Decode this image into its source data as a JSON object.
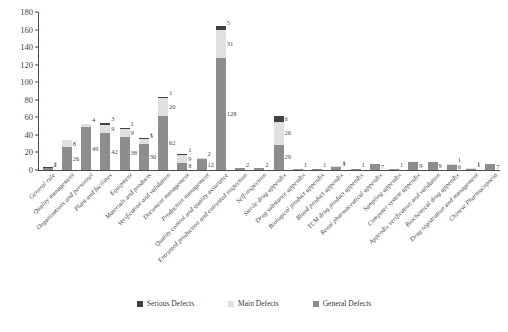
{
  "chart_data": {
    "type": "bar",
    "subtype": "stacked-bar",
    "title": "",
    "subtitle": "",
    "xlabel": "",
    "ylabel": "",
    "ylim": [
      0,
      180
    ],
    "yticks": [
      0,
      20,
      40,
      60,
      80,
      100,
      120,
      140,
      160,
      180
    ],
    "grid": false,
    "legend_position": "bottom-center",
    "stack_order": [
      "General Defects",
      "Main Defects",
      "Serious Defects"
    ],
    "categories": [
      "General rule",
      "Quality management",
      "Organizations and personnel",
      "Plant and facilities",
      "Equipment",
      "Materials and products",
      "Verification and validation",
      "Document management",
      "Production management",
      "Quality control and quality assurance",
      "Entrusted production and entrusted inspection",
      "Self-inspection",
      "Sterile drug appendix",
      "Drug substance appendix",
      "Biological product appendix",
      "Blood product appendix",
      "TCM drug product appendix",
      "Renal pharmaceutical appendix",
      "Sampling appendix",
      "Computer system appendix",
      "Appendix verification and validation",
      "Biochemical drug appendix",
      "Drug registration and management",
      "Chinese Pharmacopoeia"
    ],
    "series": [
      {
        "name": "Serious Defects",
        "color": "#404040",
        "values": [
          1,
          0,
          0,
          3,
          1,
          1,
          1,
          1,
          0,
          5,
          0,
          0,
          6,
          0,
          0,
          0,
          0,
          0,
          0,
          0,
          0,
          0,
          0,
          0
        ]
      },
      {
        "name": "Main Defects",
        "color": "#e0e0e0",
        "values": [
          0,
          8,
          4,
          9,
          9,
          5,
          20,
          9,
          2,
          31,
          0,
          0,
          26,
          0,
          0,
          1,
          0,
          0,
          0,
          0,
          0,
          1,
          1,
          0
        ]
      },
      {
        "name": "General Defects",
        "color": "#8d8d8d",
        "values": [
          2,
          26,
          49,
          42,
          38,
          30,
          62,
          8,
          12,
          128,
          2,
          2,
          29,
          1,
          1,
          3,
          1,
          7,
          1,
          9,
          9,
          6,
          1,
          7
        ]
      }
    ],
    "bar_segment_labels": [
      {
        "category": "General rule",
        "labels": [
          {
            "series": "Serious Defects",
            "value": "1"
          },
          {
            "series": "General Defects",
            "value": "2"
          }
        ]
      },
      {
        "category": "Quality management",
        "labels": [
          {
            "series": "Main Defects",
            "value": "8"
          },
          {
            "series": "General Defects",
            "value": "26"
          }
        ]
      },
      {
        "category": "Organizations and personnel",
        "labels": [
          {
            "series": "Main Defects",
            "value": "4"
          },
          {
            "series": "General Defects",
            "value": "49"
          }
        ]
      },
      {
        "category": "Plant and facilities",
        "labels": [
          {
            "series": "Serious Defects",
            "value": "3"
          },
          {
            "series": "Main Defects",
            "value": "9"
          },
          {
            "series": "General Defects",
            "value": "42"
          }
        ]
      },
      {
        "category": "Equipment",
        "labels": [
          {
            "series": "Serious Defects",
            "value": "1"
          },
          {
            "series": "Main Defects",
            "value": "9"
          },
          {
            "series": "General Defects",
            "value": "38"
          }
        ]
      },
      {
        "category": "Materials and products",
        "labels": [
          {
            "series": "Serious Defects",
            "value": "1"
          },
          {
            "series": "Main Defects",
            "value": "5"
          },
          {
            "series": "General Defects",
            "value": "30"
          }
        ]
      },
      {
        "category": "Verification and validation",
        "labels": [
          {
            "series": "Serious Defects",
            "value": "1"
          },
          {
            "series": "Main Defects",
            "value": "20"
          },
          {
            "series": "General Defects",
            "value": "62"
          }
        ]
      },
      {
        "category": "Document management",
        "labels": [
          {
            "series": "Serious Defects",
            "value": "1"
          },
          {
            "series": "Main Defects",
            "value": "9"
          },
          {
            "series": "General Defects",
            "value": "8"
          }
        ]
      },
      {
        "category": "Production management",
        "labels": [
          {
            "series": "Main Defects",
            "value": "2"
          },
          {
            "series": "General Defects",
            "value": "12"
          }
        ]
      },
      {
        "category": "Quality control and quality assurance",
        "labels": [
          {
            "series": "Serious Defects",
            "value": "5"
          },
          {
            "series": "Main Defects",
            "value": "31"
          },
          {
            "series": "General Defects",
            "value": "128"
          }
        ]
      },
      {
        "category": "Entrusted production and entrusted inspection",
        "labels": [
          {
            "series": "General Defects",
            "value": "2"
          }
        ]
      },
      {
        "category": "Self-inspection",
        "labels": [
          {
            "series": "General Defects",
            "value": "2"
          }
        ]
      },
      {
        "category": "Sterile drug appendix",
        "labels": [
          {
            "series": "Serious Defects",
            "value": "6"
          },
          {
            "series": "Main Defects",
            "value": "26"
          },
          {
            "series": "General Defects",
            "value": "29"
          }
        ]
      },
      {
        "category": "Drug substance appendix",
        "labels": [
          {
            "series": "General Defects",
            "value": "1"
          }
        ]
      },
      {
        "category": "Biological product appendix",
        "labels": [
          {
            "series": "General Defects",
            "value": "1"
          }
        ]
      },
      {
        "category": "Blood product appendix",
        "labels": [
          {
            "series": "Main Defects",
            "value": "1"
          },
          {
            "series": "General Defects",
            "value": "3"
          }
        ]
      },
      {
        "category": "TCM drug product appendix",
        "labels": [
          {
            "series": "General Defects",
            "value": "1"
          }
        ]
      },
      {
        "category": "Renal pharmaceutical appendix",
        "labels": [
          {
            "series": "General Defects",
            "value": "7"
          }
        ]
      },
      {
        "category": "Sampling appendix",
        "labels": [
          {
            "series": "General Defects",
            "value": "1"
          }
        ]
      },
      {
        "category": "Computer system appendix",
        "labels": [
          {
            "series": "General Defects",
            "value": "9"
          }
        ]
      },
      {
        "category": "Appendix verification and validation",
        "labels": [
          {
            "series": "General Defects",
            "value": "9"
          }
        ]
      },
      {
        "category": "Biochemical drug appendix",
        "labels": [
          {
            "series": "Main Defects",
            "value": "1"
          },
          {
            "series": "General Defects",
            "value": "6"
          }
        ]
      },
      {
        "category": "Drug registration and management",
        "labels": [
          {
            "series": "Main Defects",
            "value": "1"
          },
          {
            "series": "General Defects",
            "value": "1"
          }
        ]
      },
      {
        "category": "Chinese Pharmacopoeia",
        "labels": [
          {
            "series": "General Defects",
            "value": "7"
          }
        ]
      }
    ]
  },
  "legend": {
    "items": [
      {
        "label": "Serious Defects",
        "color": "#404040"
      },
      {
        "label": "Main Defects",
        "color": "#e0e0e0"
      },
      {
        "label": "General Defects",
        "color": "#8d8d8d"
      }
    ]
  }
}
